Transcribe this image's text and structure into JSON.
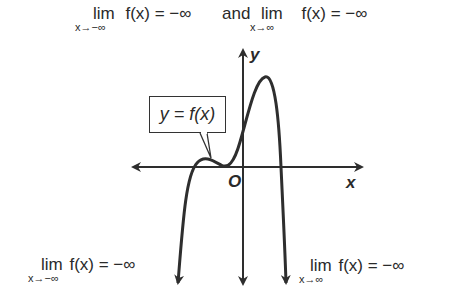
{
  "header": {
    "left_limit": {
      "lim": "lim",
      "sub": "x→−∞",
      "expr": "f(x) = −∞"
    },
    "connector": "and",
    "right_limit": {
      "lim": "lim",
      "sub": "x→∞",
      "expr": "f(x) = −∞"
    }
  },
  "graph": {
    "curve_label": "y = f(x)",
    "x_axis_label": "x",
    "y_axis_label": "y",
    "origin_label": "O"
  },
  "annotations": {
    "bottom_left": {
      "lim": "lim",
      "sub": "x→−∞",
      "expr": "f(x) = −∞"
    },
    "bottom_right": {
      "lim": "lim",
      "sub": "x→∞",
      "expr": "f(x) = −∞"
    }
  },
  "colors": {
    "stroke": "#2e2e2e",
    "background": "#ffffff"
  }
}
